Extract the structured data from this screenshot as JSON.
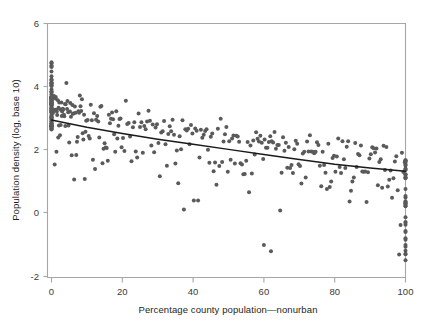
{
  "chart_data": {
    "type": "scatter",
    "title": "",
    "subtitle": "",
    "xlabel": "Percentage county population—nonurban",
    "ylabel": "Population density (log, base 10)",
    "xlim": [
      0,
      100
    ],
    "ylim": [
      -2,
      6
    ],
    "xticks": [
      0,
      20,
      40,
      60,
      80,
      100
    ],
    "yticks": [
      -2,
      0,
      2,
      4,
      6
    ],
    "xtick_labels": [
      "0",
      "20",
      "40",
      "60",
      "80",
      "100"
    ],
    "ytick_labels": [
      "-2",
      "0",
      "2",
      "4",
      "6"
    ],
    "grid": false,
    "legend": null,
    "point_color": "#5a5a5a",
    "point_size": 2.0,
    "frame_color": "#a6a6a6",
    "series": [
      {
        "name": "US counties",
        "type": "scatter",
        "n_points": 1420,
        "description": "Population density declines as the nonurban share of county population rises; dense vertical stack of fully-urban counties at x=0 spanning y 2.6 to 4.8, and a dense vertical stack of fully-nonurban counties at x=100 spanning y -1.5 to 1.7.",
        "x": [
          0,
          0,
          0,
          0,
          0,
          0,
          0,
          0,
          0,
          0,
          0,
          0,
          0,
          0,
          0,
          0,
          0,
          0,
          0,
          0,
          0,
          0,
          0,
          0,
          0,
          0,
          0,
          0,
          0,
          0,
          0,
          0,
          0,
          0,
          0,
          0,
          0,
          0,
          0,
          0,
          0,
          0,
          0,
          0,
          0,
          0,
          0,
          0,
          0,
          0,
          0,
          0,
          0,
          0,
          0,
          0,
          0,
          0,
          0,
          0,
          0,
          0,
          0,
          0,
          0,
          0,
          0,
          0,
          0,
          0,
          0,
          0,
          0,
          0,
          0,
          0,
          0,
          0,
          0,
          0,
          0,
          0,
          0,
          0,
          0,
          0,
          0,
          0,
          0,
          0,
          0.4,
          0.6,
          0.7,
          0.9,
          1.0,
          1.1,
          1.2,
          1.3,
          1.4,
          1.5,
          1.6,
          1.8,
          1.9,
          2.0,
          2.1,
          2.2,
          2.4,
          2.5,
          2.6,
          2.8,
          2.9,
          3.0,
          3.2,
          3.3,
          3.5,
          3.6,
          3.8,
          3.9,
          4.0,
          4.2,
          4.4,
          4.5,
          4.7,
          4.8,
          5.0,
          5.2,
          5.3,
          5.5,
          5.7,
          5.9,
          6.0,
          6.2,
          6.4,
          6.6,
          6.8,
          7.0,
          7.2,
          7.4,
          7.6,
          7.8,
          8.0,
          8.2,
          8.4,
          8.6,
          8.8,
          9.0,
          9.2,
          9.4,
          9.6,
          9.8,
          10.2,
          10.5,
          10.8,
          11.1,
          11.4,
          11.7,
          12.0,
          12.3,
          12.6,
          12.9,
          13.2,
          13.5,
          13.8,
          14.1,
          14.4,
          14.7,
          15.0,
          15.3,
          15.6,
          15.9,
          16.2,
          16.5,
          16.8,
          17.1,
          17.4,
          17.7,
          18.0,
          18.3,
          18.6,
          18.9,
          19.2,
          19.5,
          19.8,
          20.2,
          20.6,
          21.0,
          21.4,
          21.8,
          22.2,
          22.6,
          23.0,
          23.4,
          23.8,
          24.2,
          24.6,
          25.0,
          25.4,
          25.8,
          26.2,
          26.6,
          27.0,
          27.4,
          27.8,
          28.2,
          28.6,
          29.0,
          29.4,
          29.8,
          30.2,
          30.6,
          31.0,
          31.4,
          31.8,
          32.2,
          32.6,
          33.0,
          33.4,
          33.8,
          34.2,
          34.6,
          35.0,
          35.4,
          35.8,
          36.2,
          36.6,
          37.0,
          37.4,
          37.8,
          38.2,
          38.6,
          39.0,
          39.4,
          39.8,
          40.2,
          40.6,
          41.0,
          41.4,
          41.8,
          42.2,
          42.6,
          43.0,
          43.4,
          43.8,
          44.2,
          44.6,
          45.0,
          45.4,
          45.8,
          46.2,
          46.6,
          47.0,
          47.4,
          47.8,
          48.2,
          48.6,
          49.0,
          49.4,
          49.8,
          50.2,
          50.6,
          51.0,
          51.4,
          51.8,
          52.2,
          52.6,
          53.0,
          53.4,
          53.8,
          54.2,
          54.6,
          55.0,
          55.4,
          55.8,
          56.2,
          56.6,
          57.0,
          57.4,
          57.8,
          58.2,
          58.6,
          59.0,
          59.4,
          59.8,
          60.2,
          60.6,
          61.0,
          61.4,
          61.8,
          62.2,
          62.6,
          63.0,
          63.4,
          63.8,
          64.2,
          64.6,
          65.0,
          65.4,
          65.8,
          66.2,
          66.6,
          67.0,
          67.4,
          67.8,
          68.2,
          68.6,
          69.0,
          69.4,
          69.8,
          70.2,
          70.6,
          71.0,
          71.4,
          71.8,
          72.2,
          72.6,
          73.0,
          73.4,
          73.8,
          74.2,
          74.6,
          75.0,
          75.4,
          75.8,
          76.2,
          76.6,
          77.0,
          77.4,
          77.8,
          78.2,
          78.6,
          79.0,
          79.4,
          79.8,
          80.2,
          80.6,
          81.0,
          81.4,
          81.8,
          82.2,
          82.6,
          83.0,
          83.4,
          83.8,
          84.2,
          84.6,
          85.0,
          85.4,
          85.8,
          86.2,
          86.6,
          87.0,
          87.4,
          87.8,
          88.2,
          88.6,
          89.0,
          89.4,
          89.8,
          90.2,
          90.6,
          91.0,
          91.4,
          91.8,
          92.2,
          92.6,
          93.0,
          93.4,
          93.8,
          94.2,
          94.6,
          95.0,
          95.4,
          95.8,
          96.2,
          96.6,
          97.0,
          97.4,
          97.8,
          98.2,
          98.6,
          99.0,
          99.4,
          99.8,
          100,
          100,
          100,
          100,
          100,
          100,
          100,
          100,
          100,
          100,
          100,
          100,
          100,
          100,
          100,
          100,
          100,
          100,
          100,
          100,
          100,
          100,
          100,
          100,
          100,
          100,
          100,
          100,
          100,
          100,
          100,
          100,
          100,
          100,
          100,
          100,
          100,
          100,
          100,
          100
        ],
        "y_note": "y values generated from the fitted relation y = 2.95 - 0.0165x with heteroscedastic spread; see rendering seed"
      }
    ],
    "trend_line": {
      "name": "fitted trend",
      "type": "line",
      "color": "#1a1a1a",
      "x": [
        0,
        10,
        20,
        30,
        40,
        50,
        60,
        70,
        80,
        90,
        100
      ],
      "y": [
        2.95,
        2.72,
        2.52,
        2.34,
        2.18,
        2.02,
        1.86,
        1.7,
        1.55,
        1.43,
        1.33
      ]
    },
    "annotations": [
      {
        "label": "high-density urban outliers at x=0",
        "x": 0,
        "y": 4.8
      },
      {
        "label": "low-density outliers",
        "x": 60,
        "y": -1.0
      },
      {
        "label": "low-density outliers",
        "x": 62,
        "y": -1.2
      }
    ]
  },
  "axes": {
    "x_title": "Percentage county population—nonurban",
    "y_title": "Population density (log, base 10)",
    "x_tick_0": "0",
    "x_tick_1": "20",
    "x_tick_2": "40",
    "x_tick_3": "60",
    "x_tick_4": "80",
    "x_tick_5": "100",
    "y_tick_0": "6",
    "y_tick_1": "4",
    "y_tick_2": "2",
    "y_tick_3": "0",
    "y_tick_4": "-2"
  }
}
